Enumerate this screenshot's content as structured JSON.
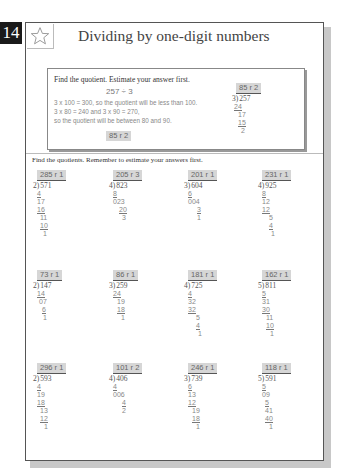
{
  "page": {
    "number": "14",
    "title": "Dividing by one-digit numbers",
    "icon": "star-icon"
  },
  "example": {
    "instruction": "Find the quotient. Estimate your answer first.",
    "equation": "257 ÷ 3",
    "lines": [
      "3 x 100 = 300, so the quotient will be less than 100.",
      "3 x 80 = 240 and 3 x 90 = 270,",
      "so the quotient will be between 80 and 90."
    ],
    "answer": "85 r 2",
    "work": {
      "quotient": "85 r 2",
      "divisor": "3",
      "dividend": "257",
      "steps": [
        {
          "text": "24",
          "underline": true,
          "indent": 2
        },
        {
          "text": "17",
          "underline": false,
          "indent": 6
        },
        {
          "text": "15",
          "underline": true,
          "indent": 6
        },
        {
          "text": "2",
          "underline": false,
          "indent": 9
        }
      ]
    }
  },
  "main": {
    "instruction": "Find the quotients. Remember to estimate your answers first.",
    "problems": [
      {
        "quotient": "285 r 1",
        "divisor": "2",
        "dividend": "571",
        "steps": [
          [
            "4",
            true,
            4
          ],
          [
            "17",
            false,
            4
          ],
          [
            "16",
            true,
            4
          ],
          [
            "11",
            false,
            7
          ],
          [
            "10",
            true,
            7
          ],
          [
            "1",
            false,
            10
          ]
        ]
      },
      {
        "quotient": "205 r 3",
        "divisor": "4",
        "dividend": "823",
        "steps": [
          [
            "8",
            true,
            4
          ],
          [
            "023",
            false,
            4
          ],
          [
            "20",
            true,
            10
          ],
          [
            "3",
            false,
            13
          ]
        ]
      },
      {
        "quotient": "201 r 1",
        "divisor": "3",
        "dividend": "604",
        "steps": [
          [
            "6",
            true,
            4
          ],
          [
            "004",
            false,
            4
          ],
          [
            "3",
            true,
            13
          ],
          [
            "1",
            false,
            13
          ]
        ]
      },
      {
        "quotient": "231 r 1",
        "divisor": "4",
        "dividend": "925",
        "steps": [
          [
            "8",
            true,
            4
          ],
          [
            "12",
            false,
            4
          ],
          [
            "12",
            true,
            4
          ],
          [
            "5",
            false,
            11
          ],
          [
            "4",
            true,
            11
          ],
          [
            "1",
            false,
            13
          ]
        ]
      },
      {
        "quotient": "73 r 1",
        "divisor": "2",
        "dividend": "147",
        "steps": [
          [
            "14",
            true,
            4
          ],
          [
            "07",
            false,
            6
          ],
          [
            "6",
            true,
            9
          ],
          [
            "1",
            false,
            10
          ]
        ]
      },
      {
        "quotient": "86 r 1",
        "divisor": "3",
        "dividend": "259",
        "steps": [
          [
            "24",
            true,
            4
          ],
          [
            "19",
            false,
            8
          ],
          [
            "18",
            true,
            8
          ],
          [
            "1",
            false,
            12
          ]
        ]
      },
      {
        "quotient": "181 r 1",
        "divisor": "4",
        "dividend": "725",
        "steps": [
          [
            "4",
            true,
            4
          ],
          [
            "32",
            false,
            4
          ],
          [
            "32",
            true,
            4
          ],
          [
            "5",
            false,
            12
          ],
          [
            "4",
            true,
            12
          ],
          [
            "1",
            false,
            14
          ]
        ]
      },
      {
        "quotient": "162 r 1",
        "divisor": "5",
        "dividend": "811",
        "steps": [
          [
            "5",
            true,
            4
          ],
          [
            "31",
            false,
            4
          ],
          [
            "30",
            true,
            4
          ],
          [
            "11",
            false,
            8
          ],
          [
            "10",
            true,
            8
          ],
          [
            "1",
            false,
            12
          ]
        ]
      },
      {
        "quotient": "296 r 1",
        "divisor": "2",
        "dividend": "593",
        "steps": [
          [
            "4",
            true,
            4
          ],
          [
            "19",
            false,
            4
          ],
          [
            "18",
            true,
            4
          ],
          [
            "13",
            false,
            7
          ],
          [
            "12",
            true,
            7
          ],
          [
            "1",
            false,
            11
          ]
        ]
      },
      {
        "quotient": "101 r 2",
        "divisor": "4",
        "dividend": "406",
        "steps": [
          [
            "4",
            true,
            4
          ],
          [
            "006",
            false,
            4
          ],
          [
            "4",
            true,
            13
          ],
          [
            "2",
            false,
            13
          ]
        ]
      },
      {
        "quotient": "246 r 1",
        "divisor": "3",
        "dividend": "739",
        "steps": [
          [
            "6",
            true,
            4
          ],
          [
            "13",
            false,
            4
          ],
          [
            "12",
            true,
            4
          ],
          [
            "19",
            false,
            8
          ],
          [
            "18",
            true,
            8
          ],
          [
            "1",
            false,
            12
          ]
        ]
      },
      {
        "quotient": "118 r 1",
        "divisor": "5",
        "dividend": "591",
        "steps": [
          [
            "5",
            true,
            4
          ],
          [
            "09",
            false,
            4
          ],
          [
            "5",
            true,
            7
          ],
          [
            "41",
            false,
            7
          ],
          [
            "40",
            true,
            7
          ],
          [
            "1",
            false,
            11
          ]
        ]
      }
    ]
  },
  "colors": {
    "page_number_bg": "#1a1a1a",
    "answer_chip_bg": "#d6d6d6",
    "frame_border": "#555555",
    "shadow": "#c8c8c8"
  }
}
